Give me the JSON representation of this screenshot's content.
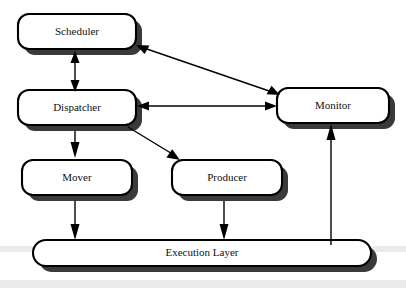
{
  "diagram": {
    "type": "block-diagram",
    "background_color": "#ffffff",
    "node_fill_color": "#ffffff",
    "node_border_color": "#000000",
    "node_shadow_color": "#3a3a3a",
    "edge_color": "#000000",
    "nodes": [
      {
        "id": "scheduler",
        "label": "Scheduler",
        "shape": "rounded-rectangle",
        "x": 18,
        "y": 14,
        "width": 118,
        "height": 35,
        "radius": 11
      },
      {
        "id": "dispatcher",
        "label": "Dispatcher",
        "shape": "rounded-rectangle",
        "x": 18,
        "y": 90,
        "width": 118,
        "height": 35,
        "radius": 11
      },
      {
        "id": "monitor",
        "label": "Monitor",
        "shape": "rounded-rectangle",
        "x": 277,
        "y": 88,
        "width": 112,
        "height": 35,
        "radius": 11
      },
      {
        "id": "mover",
        "label": "Mover",
        "shape": "rounded-rectangle",
        "x": 22,
        "y": 160,
        "width": 110,
        "height": 35,
        "radius": 11
      },
      {
        "id": "producer",
        "label": "Producer",
        "shape": "rounded-rectangle",
        "x": 172,
        "y": 160,
        "width": 110,
        "height": 35,
        "radius": 11
      },
      {
        "id": "execution-layer",
        "label": "Execution Layer",
        "shape": "pill",
        "x": 33,
        "y": 240,
        "width": 338,
        "height": 26,
        "radius": 13
      }
    ],
    "edges": [
      {
        "id": "scheduler-dispatcher",
        "from": "scheduler",
        "to": "dispatcher",
        "direction": "bidirectional",
        "style": "straight-vertical"
      },
      {
        "id": "scheduler-monitor",
        "from": "scheduler",
        "to": "monitor",
        "direction": "bidirectional",
        "style": "diagonal"
      },
      {
        "id": "dispatcher-monitor",
        "from": "dispatcher",
        "to": "monitor",
        "direction": "bidirectional",
        "style": "straight-horizontal"
      },
      {
        "id": "dispatcher-mover",
        "from": "dispatcher",
        "to": "mover",
        "direction": "unidirectional",
        "style": "straight-vertical"
      },
      {
        "id": "dispatcher-producer",
        "from": "dispatcher",
        "to": "producer",
        "direction": "unidirectional",
        "style": "diagonal"
      },
      {
        "id": "mover-execution-layer",
        "from": "mover",
        "to": "execution-layer",
        "direction": "unidirectional",
        "style": "straight-vertical"
      },
      {
        "id": "producer-execution-layer",
        "from": "producer",
        "to": "execution-layer",
        "direction": "unidirectional",
        "style": "straight-vertical"
      },
      {
        "id": "execution-layer-monitor",
        "from": "execution-layer",
        "to": "monitor",
        "direction": "unidirectional",
        "style": "straight-vertical"
      }
    ]
  }
}
